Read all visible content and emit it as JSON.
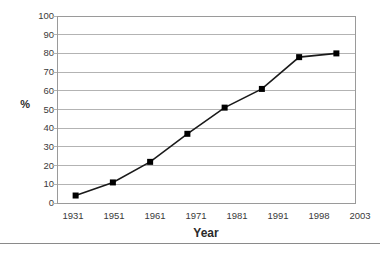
{
  "chart_data": {
    "type": "line",
    "title": "",
    "subtitle": "",
    "xlabel": "Year",
    "ylabel": "%",
    "categories": [
      "1931",
      "1951",
      "1961",
      "1971",
      "1981",
      "1991",
      "1998",
      "2003"
    ],
    "x": [
      1931,
      1951,
      1961,
      1971,
      1981,
      1991,
      1998,
      2003
    ],
    "values": [
      4,
      11,
      22,
      37,
      51,
      61,
      78,
      80
    ],
    "series": [
      {
        "name": "",
        "values": [
          4,
          11,
          22,
          37,
          51,
          61,
          78,
          80
        ]
      }
    ],
    "ylim": [
      0,
      100
    ],
    "yticks": [
      0,
      10,
      20,
      30,
      40,
      50,
      60,
      70,
      80,
      90,
      100
    ],
    "ytick_labels": [
      "0",
      "10",
      "20",
      "30",
      "40",
      "50",
      "60",
      "70",
      "80",
      "90",
      "100"
    ],
    "xtick_labels": [
      "1931",
      "1951",
      "1961",
      "1971",
      "1981",
      "1991",
      "1998",
      "2003"
    ],
    "grid": "horizontal",
    "legend": "none",
    "marker": "square",
    "marker_color": "#000000",
    "line_color": "#1a1a1a",
    "gridline_color": "#b3b3b3",
    "plot_border_color": "#9a9a9a",
    "plot_background": "#ffffff",
    "annotations": []
  },
  "figure": {
    "y_axis_title": "%",
    "x_axis_title": "Year"
  }
}
